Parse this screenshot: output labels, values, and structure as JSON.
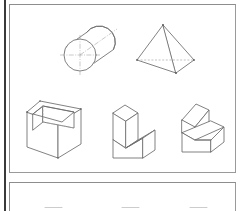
{
  "document": {
    "title": "Isometric Solids Worksheet",
    "background_color": "#ffffff",
    "line_color": "#6b6b6b",
    "hidden_line_color": "#a9a9a9",
    "center_line_color": "#a5a5a5",
    "border_color": "#9a9a9a",
    "edge_rule_color": "#3a3a3a"
  },
  "panels": [
    {
      "name": "upper-figure-panel",
      "x": 9,
      "y": 4,
      "width": 227,
      "height": 169,
      "rows": [
        {
          "name": "row-curved-and-faceted-solids",
          "figures": [
            "cylinder",
            "pyramid"
          ]
        },
        {
          "name": "row-prismatic-solids",
          "figures": [
            "open-box",
            "step-block",
            "ramp-block"
          ]
        }
      ]
    },
    {
      "name": "lower-figure-panel",
      "x": 9,
      "y": 182,
      "width": 227,
      "height": 40,
      "rows": [
        {
          "name": "row-clipped-solids",
          "figures": [
            "clipped-shape-left",
            "clipped-shape-center",
            "clipped-shape-right"
          ]
        }
      ]
    }
  ],
  "figures": {
    "cylinder": {
      "label": "cylinder",
      "description": "Oblique cylinder with front circular face, centerlines and axis line",
      "front_circle": {
        "cx": 80,
        "cy": 55,
        "r": 16
      },
      "back_circle": {
        "cx": 100,
        "cy": 41,
        "r": 16
      },
      "has_centerlines": true,
      "has_axis_line": true
    },
    "pyramid": {
      "label": "pyramid",
      "description": "Square-base pyramid in isometric view with one hidden base edge dashed",
      "apex": {
        "x": 163,
        "y": 25
      },
      "base_left": {
        "x": 137,
        "y": 60
      },
      "base_right": {
        "x": 194,
        "y": 60
      },
      "base_front": {
        "x": 176,
        "y": 73
      },
      "hidden_edge": "base_left-to-base_right",
      "has_vertex_dots": true
    },
    "open-box": {
      "label": "open-box",
      "description": "Rectangular box with open top showing inner walls and a hidden inner edge",
      "width": 58,
      "height": 58,
      "has_hidden_inner_edge": true
    },
    "step-block": {
      "label": "step-block",
      "description": "L-shaped step block, single notch cut from the upper front corner",
      "width": 46,
      "height": 48
    },
    "ramp-block": {
      "label": "ramp-block",
      "description": "Block with an inclined ramp face rising from front to back",
      "width": 46,
      "height": 48
    },
    "clipped-shape-left": {
      "label": "clipped-shape-left",
      "description": "Top edge of a solid, cut off by the bottom of the screenshot"
    },
    "clipped-shape-center": {
      "label": "clipped-shape-center",
      "description": "Top edge of a solid, cut off by the bottom of the screenshot"
    },
    "clipped-shape-right": {
      "label": "clipped-shape-right",
      "description": "Top edge of a solid, cut off by the bottom of the screenshot"
    }
  }
}
